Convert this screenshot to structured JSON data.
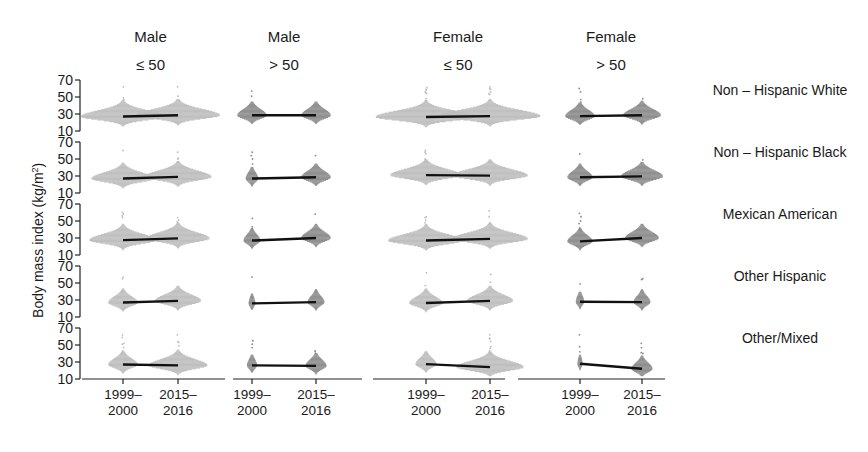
{
  "chart_data": {
    "type": "scatter",
    "subtype": "beeswarm-with-mean-lines",
    "ylabel": "Body mass index (kg/m²)",
    "ylabel_parts": {
      "main": "Body mass index (kg/m",
      "sup": "2",
      "end": ")"
    },
    "ylim": [
      10,
      70
    ],
    "yticks": [
      "10",
      "30",
      "50",
      "70"
    ],
    "x_categories": [
      [
        "1999–",
        "2000"
      ],
      [
        "2015–",
        "2016"
      ]
    ],
    "columns": [
      {
        "title": "Male",
        "subtitle": "≤ 50"
      },
      {
        "title": "Male",
        "subtitle": "> 50"
      },
      {
        "title": "Female",
        "subtitle": "≤ 50"
      },
      {
        "title": "Female",
        "subtitle": "> 50"
      }
    ],
    "rows": [
      {
        "label": "Non – Hispanic White"
      },
      {
        "label": "Non – Hispanic Black"
      },
      {
        "label": "Mexican American"
      },
      {
        "label": "Other Hispanic"
      },
      {
        "label": "Other/Mixed"
      }
    ],
    "mean_bmi_estimated": [
      [
        [
          27,
          28.5
        ],
        [
          28.5,
          28.5
        ],
        [
          26.5,
          27.5
        ],
        [
          27.5,
          28.5
        ]
      ],
      [
        [
          27,
          29
        ],
        [
          27,
          28.5
        ],
        [
          31,
          30.5
        ],
        [
          28.5,
          29.5
        ]
      ],
      [
        [
          27.5,
          29.5
        ],
        [
          27,
          30
        ],
        [
          27,
          29
        ],
        [
          26,
          30
        ]
      ],
      [
        [
          27,
          29
        ],
        [
          26,
          27.5
        ],
        [
          26.5,
          29
        ],
        [
          28,
          27.5
        ]
      ],
      [
        [
          27,
          26
        ],
        [
          26,
          25.5
        ],
        [
          27.5,
          24
        ],
        [
          28,
          22
        ]
      ]
    ],
    "swarm_width_scale": [
      [
        [
          1.0,
          1.0
        ],
        [
          0.35,
          0.35
        ],
        [
          1.2,
          1.2
        ],
        [
          0.35,
          0.45
        ]
      ],
      [
        [
          0.75,
          0.8
        ],
        [
          0.15,
          0.35
        ],
        [
          0.85,
          0.9
        ],
        [
          0.3,
          0.5
        ]
      ],
      [
        [
          0.8,
          0.75
        ],
        [
          0.2,
          0.35
        ],
        [
          0.9,
          0.9
        ],
        [
          0.3,
          0.4
        ]
      ],
      [
        [
          0.35,
          0.55
        ],
        [
          0.08,
          0.2
        ],
        [
          0.4,
          0.55
        ],
        [
          0.1,
          0.2
        ]
      ],
      [
        [
          0.35,
          0.7
        ],
        [
          0.12,
          0.25
        ],
        [
          0.25,
          0.8
        ],
        [
          0.06,
          0.25
        ]
      ]
    ],
    "swarm_colors": {
      "age_le50": "#bdbdbd",
      "age_gt50": "#8a8a8a"
    },
    "mean_line_color": "#111111",
    "grid": false,
    "legend": "none"
  }
}
